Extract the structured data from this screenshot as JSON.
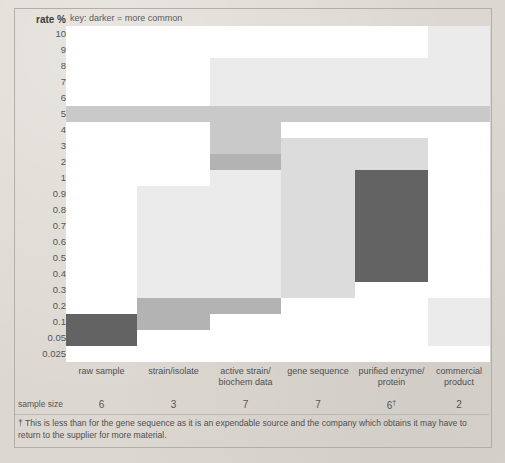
{
  "key_text": "key: darker = more common",
  "axis": {
    "title": "rate %",
    "ticks": [
      "10",
      "9",
      "8",
      "7",
      "6",
      "5",
      "4",
      "3",
      "2",
      "1",
      "0.9",
      "0.8",
      "0.7",
      "0.6",
      "0.5",
      "0.4",
      "0.3",
      "0.2",
      "0.1",
      "0.05",
      "0.025"
    ]
  },
  "sample_size_label": "sample size",
  "footnote": "† This is less than for the gene sequence as it is an expendable source and the company which obtains it may have to return to the supplier for more material.",
  "colors": {
    "background": "#dcd8d1",
    "plot_blank": "#ffffff",
    "shade_1": "#ebebeb",
    "shade_2": "#dcdcdc",
    "shade_3": "#c9c9c9",
    "shade_4": "#b3b3b3",
    "shade_5": "#8f8f8f",
    "shade_6": "#636363",
    "frame": "#b4afa6"
  },
  "chart_data": {
    "type": "heatmap",
    "title": "",
    "xlabel": "",
    "ylabel": "rate %",
    "legend_note": "key: darker = more common",
    "y_categories": [
      "10",
      "9",
      "8",
      "7",
      "6",
      "5",
      "4",
      "3",
      "2",
      "1",
      "0.9",
      "0.8",
      "0.7",
      "0.6",
      "0.5",
      "0.4",
      "0.3",
      "0.2",
      "0.1",
      "0.05",
      "0.025"
    ],
    "categories": [
      {
        "label_lines": [
          "raw sample"
        ],
        "sample_size": "6"
      },
      {
        "label_lines": [
          "strain/isolate"
        ],
        "sample_size": "3"
      },
      {
        "label_lines": [
          "active strain/",
          "biochem data"
        ],
        "sample_size": "7"
      },
      {
        "label_lines": [
          "gene sequence"
        ],
        "sample_size": "7"
      },
      {
        "label_lines": [
          "purified enzyme/",
          "protein"
        ],
        "sample_size": "6",
        "sample_size_dagger": "†"
      },
      {
        "label_lines": [
          "commercial",
          "product"
        ],
        "sample_size": "2"
      }
    ],
    "cells": [
      {
        "column": "raw sample",
        "y_from": "5",
        "y_to": "5",
        "intensity": 3
      },
      {
        "column": "raw sample",
        "y_from": "0.1",
        "y_to": "0.05",
        "intensity": 6
      },
      {
        "column": "strain/isolate",
        "y_from": "5",
        "y_to": "5",
        "intensity": 3
      },
      {
        "column": "strain/isolate",
        "y_from": "0.9",
        "y_to": "0.3",
        "intensity": 1
      },
      {
        "column": "strain/isolate",
        "y_from": "0.2",
        "y_to": "0.1",
        "intensity": 4
      },
      {
        "column": "active strain/biochem data",
        "y_from": "8",
        "y_to": "6",
        "intensity": 1
      },
      {
        "column": "active strain/biochem data",
        "y_from": "5",
        "y_to": "5",
        "intensity": 3
      },
      {
        "column": "active strain/biochem data",
        "y_from": "4",
        "y_to": "3",
        "intensity": 3
      },
      {
        "column": "active strain/biochem data",
        "y_from": "2",
        "y_to": "2",
        "intensity": 4
      },
      {
        "column": "active strain/biochem data",
        "y_from": "1",
        "y_to": "0.3",
        "intensity": 1
      },
      {
        "column": "active strain/biochem data",
        "y_from": "0.2",
        "y_to": "0.2",
        "intensity": 4
      },
      {
        "column": "gene sequence",
        "y_from": "8",
        "y_to": "6",
        "intensity": 1
      },
      {
        "column": "gene sequence",
        "y_from": "5",
        "y_to": "5",
        "intensity": 3
      },
      {
        "column": "gene sequence",
        "y_from": "3",
        "y_to": "0.3",
        "intensity": 2
      },
      {
        "column": "purified enzyme/protein",
        "y_from": "8",
        "y_to": "6",
        "intensity": 1
      },
      {
        "column": "purified enzyme/protein",
        "y_from": "5",
        "y_to": "5",
        "intensity": 3
      },
      {
        "column": "purified enzyme/protein",
        "y_from": "3",
        "y_to": "2",
        "intensity": 2
      },
      {
        "column": "purified enzyme/protein",
        "y_from": "1",
        "y_to": "0.4",
        "intensity": 6
      },
      {
        "column": "commercial product",
        "y_from": "10",
        "y_to": "6",
        "intensity": 1
      },
      {
        "column": "commercial product",
        "y_from": "5",
        "y_to": "5",
        "intensity": 3
      },
      {
        "column": "commercial product",
        "y_from": "0.2",
        "y_to": "0.05",
        "intensity": 1
      }
    ]
  }
}
